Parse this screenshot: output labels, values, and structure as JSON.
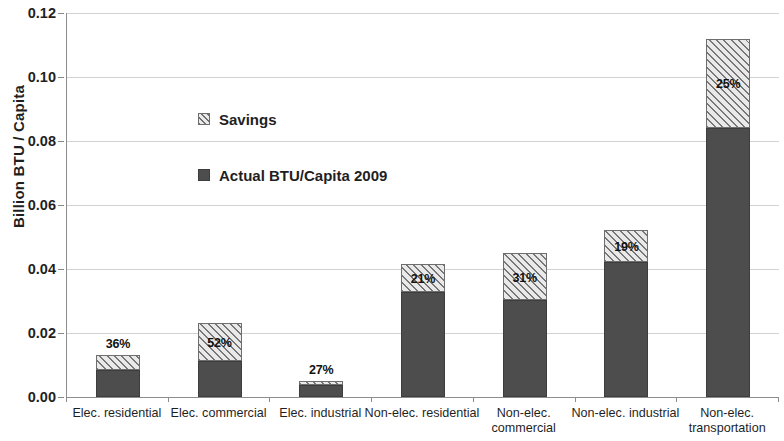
{
  "chart_data": {
    "type": "bar",
    "title": "",
    "subtitle": "",
    "xlabel": "",
    "ylabel": "Billion BTU / Capita",
    "ylim": [
      0,
      0.12
    ],
    "ytick_step": 0.02,
    "ytick_labels": [
      "0.00",
      "0.02",
      "0.04",
      "0.06",
      "0.08",
      "0.10",
      "0.12"
    ],
    "ytick_values": [
      0,
      0.02,
      0.04,
      0.06,
      0.08,
      0.1,
      0.12
    ],
    "grid": "horizontal",
    "stacked": true,
    "legend_position": "inside-upper-left",
    "categories": [
      "Elec. residential",
      "Elec. commercial",
      "Elec. industrial",
      "Non-elec. residential",
      "Non-elec. commercial",
      "Non-elec. industrial",
      "Non-elec. transportation"
    ],
    "series": [
      {
        "name": "Actual BTU/Capita 2009",
        "fill": "solid",
        "color": "#4d4d4d",
        "values": [
          0.0084,
          0.0113,
          0.0037,
          0.0328,
          0.0303,
          0.0422,
          0.084
        ]
      },
      {
        "name": "Savings",
        "fill": "hatched",
        "color": "#e9e9e9",
        "values": [
          0.0047,
          0.0118,
          0.0013,
          0.0087,
          0.0147,
          0.01,
          0.028
        ]
      }
    ],
    "totals": [
      0.0131,
      0.0231,
      0.005,
      0.0415,
      0.045,
      0.0522,
      0.112
    ],
    "savings_labels": [
      "36%",
      "52%",
      "27%",
      "21%",
      "31%",
      "19%",
      "25%"
    ],
    "savings_label_placement": [
      "above",
      "inside",
      "above",
      "inside",
      "inside",
      "inside",
      "inside"
    ]
  },
  "legend": {
    "items": [
      {
        "label": "Savings",
        "swatch": "hatched-swatch"
      },
      {
        "label": "Actual BTU/Capita 2009",
        "swatch": "solid-swatch"
      }
    ]
  },
  "colors": {
    "actual": "#4d4d4d",
    "savings_fill": "#e9e9e9",
    "savings_hatch": "#777777",
    "gridline": "#d2d2d2",
    "axis": "#8d8d8d",
    "text": "#1f1f1f"
  }
}
